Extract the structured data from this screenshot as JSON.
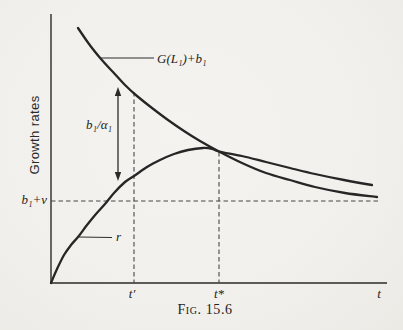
{
  "figure": {
    "caption": "Fig. 15.6",
    "y_axis_label": "Growth rates",
    "x_axis_label": "t"
  },
  "labels": {
    "curve_g": "G(L₁)+b₁",
    "curve_r": "r",
    "gap_arrow": "b₁/α₁",
    "asymptote": "b₁+ν",
    "tick_t_prime": "t′",
    "tick_t_star": "t*"
  },
  "colors": {
    "paper": "#f1f0ec",
    "ink": "#2a2a2a",
    "dash": "#474747"
  },
  "chart_data": {
    "type": "line",
    "title": "Fig. 15.6",
    "xlabel": "t",
    "ylabel": "Growth rates",
    "x_ticks": [
      "t′",
      "t*",
      "t"
    ],
    "grid": false,
    "legend": "inline curve labels with leader lines",
    "annotations": [
      {
        "name": "gap_arrow",
        "label": "b₁/α₁",
        "meaning": "vertical gap between G(L₁)+b₁ and r at t′, marked by double-headed arrow"
      },
      {
        "name": "asymptote",
        "label": "b₁+ν",
        "meaning": "horizontal dashed line; common asymptotic growth rate"
      },
      {
        "name": "t_prime",
        "label": "t′",
        "meaning": "dashed vertical from G(L₁)+b₁ curve to x-axis"
      },
      {
        "name": "t_star",
        "label": "t*",
        "meaning": "dashed vertical from curve intersection to x-axis; r reaches maximum and crosses G(L₁)+b₁"
      }
    ],
    "series": [
      {
        "name": "G(L₁)+b₁",
        "shape": "monotonically declining convex curve, crosses r at t* then approaches b₁+ν from above",
        "points_px": [
          [
            78,
            28
          ],
          [
            89,
            44
          ],
          [
            101,
            59
          ],
          [
            113,
            72
          ],
          [
            125,
            85
          ],
          [
            137,
            96
          ],
          [
            152,
            108
          ],
          [
            168,
            120
          ],
          [
            184,
            131
          ],
          [
            200,
            141
          ],
          [
            219,
            151.5
          ],
          [
            242,
            163
          ],
          [
            266,
            173
          ],
          [
            290,
            180
          ],
          [
            315,
            187
          ],
          [
            345,
            193
          ],
          [
            377,
            197
          ]
        ]
      },
      {
        "name": "r",
        "shape": "rises concavely from origin, peaks near t*, then declines gently above G(L₁)+b₁",
        "points_px": [
          [
            51,
            283
          ],
          [
            57,
            269
          ],
          [
            64,
            255
          ],
          [
            71,
            245
          ],
          [
            78,
            237
          ],
          [
            87,
            225
          ],
          [
            96,
            214
          ],
          [
            105,
            204
          ],
          [
            114,
            193
          ],
          [
            125,
            182
          ],
          [
            134,
            176
          ],
          [
            147,
            167
          ],
          [
            160,
            160
          ],
          [
            174,
            154
          ],
          [
            188,
            150
          ],
          [
            203,
            148
          ],
          [
            212,
            148.8
          ],
          [
            219,
            151.5
          ],
          [
            242,
            156
          ],
          [
            266,
            162
          ],
          [
            290,
            168
          ],
          [
            315,
            174
          ],
          [
            344,
            180
          ],
          [
            372,
            185
          ]
        ]
      }
    ],
    "layout_px": {
      "origin": [
        51,
        283
      ],
      "y_axis_top": 14,
      "x_axis_right": 387,
      "t_prime_x": 134,
      "t_prime_top_y": 92,
      "t_star_x": 219,
      "t_star_top_y": 152,
      "asymptote_y": 201,
      "asymptote_x_end": 379,
      "gap_arrow": {
        "x": 118,
        "y_top": 87,
        "y_bottom": 181
      },
      "leader_g": [
        [
          100,
          58
        ],
        [
          154,
          58
        ]
      ],
      "leader_r": [
        [
          78,
          237
        ],
        [
          112,
          237.5
        ]
      ]
    }
  }
}
